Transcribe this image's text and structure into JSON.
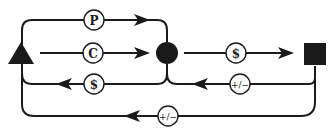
{
  "diagram": {
    "nodes": [
      {
        "id": "triangle",
        "shape": "triangle",
        "color": "#111111"
      },
      {
        "id": "circle",
        "shape": "circle",
        "color": "#111111"
      },
      {
        "id": "square",
        "shape": "square",
        "color": "#111111"
      }
    ],
    "edges": [
      {
        "id": "p-flow",
        "from": "triangle",
        "to": "circle",
        "label": "P",
        "direction": "right"
      },
      {
        "id": "c-flow",
        "from": "triangle",
        "to": "circle",
        "label": "C",
        "direction": "right"
      },
      {
        "id": "money-return-1",
        "from": "circle",
        "to": "triangle",
        "label": "$",
        "direction": "left"
      },
      {
        "id": "money-flow",
        "from": "circle",
        "to": "square",
        "label": "$",
        "direction": "right"
      },
      {
        "id": "adjust-return-1",
        "from": "square",
        "to": "circle",
        "label": "+/−",
        "direction": "left"
      },
      {
        "id": "adjust-return-2",
        "from": "square",
        "to": "triangle",
        "label": "+/−",
        "direction": "left"
      }
    ]
  }
}
